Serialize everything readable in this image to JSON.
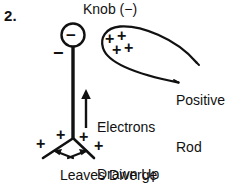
{
  "figure": {
    "item_number": "2.",
    "background_color": "#ffffff",
    "ink_color": "#111111",
    "width": 241,
    "height": 194
  },
  "labels": {
    "knob": "Knob (−)",
    "rod_line1": "Positive",
    "rod_line2": "Rod",
    "electrons_line1": "Electrons",
    "electrons_line2": "Drawn Up",
    "leaves": "Leaves Diverge"
  },
  "charges": {
    "knob_circle_sign": "−",
    "stem_top_sign": "−",
    "rod_signs": [
      "+",
      "+",
      "+",
      "+"
    ],
    "leaf_signs": [
      "+",
      "+",
      "+",
      "+"
    ]
  },
  "annotations": {
    "electron_arrow_direction": "up",
    "leaf_arrow_left_direction": "down-left",
    "leaf_arrow_right_direction": "down-right"
  }
}
